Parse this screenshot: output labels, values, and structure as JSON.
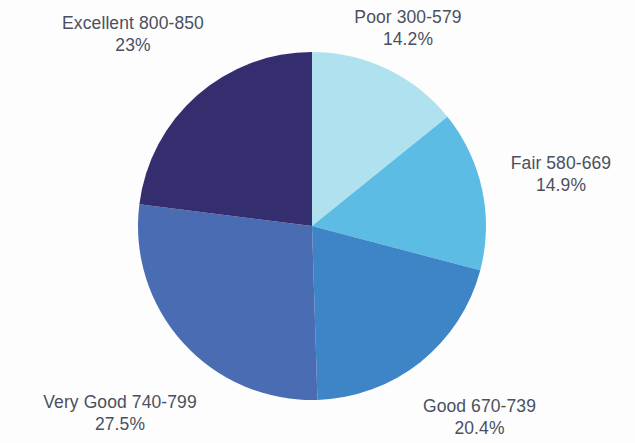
{
  "chart_data": {
    "type": "pie",
    "title": "",
    "subtitle": "",
    "xlabel": "",
    "ylabel": "",
    "legend_position": "none",
    "grid": false,
    "background_color": "#fdfdfd",
    "label_text_color": "#4a5060",
    "start_angle_deg": 0,
    "direction": "clockwise",
    "center": {
      "x": 312,
      "y": 226
    },
    "radius": 174,
    "categories": [
      "Poor 300-579",
      "Fair 580-669",
      "Good 670-739",
      "Very Good 740-799",
      "Excellent 800-850"
    ],
    "values": [
      14.2,
      14.9,
      20.4,
      27.5,
      23
    ],
    "value_labels": [
      "14.2%",
      "14.9%",
      "20.4%",
      "27.5%",
      "23%"
    ],
    "colors": [
      "#b0e1ef",
      "#5cbce4",
      "#3d85c6",
      "#4a6cb3",
      "#342d6e"
    ],
    "slices": [
      {
        "name": "Poor 300-579",
        "value": 14.2,
        "value_label": "14.2%",
        "color": "#b0e1ef",
        "start_deg": 0,
        "end_deg": 51.12
      },
      {
        "name": "Fair 580-669",
        "value": 14.9,
        "value_label": "14.9%",
        "color": "#5cbce4",
        "start_deg": 51.12,
        "end_deg": 104.76
      },
      {
        "name": "Good 670-739",
        "value": 20.4,
        "value_label": "20.4%",
        "color": "#3d85c6",
        "start_deg": 104.76,
        "end_deg": 178.2
      },
      {
        "name": "Very Good 740-799",
        "value": 27.5,
        "value_label": "27.5%",
        "color": "#4a6cb3",
        "start_deg": 178.2,
        "end_deg": 277.2
      },
      {
        "name": "Excellent 800-850",
        "value": 23,
        "value_label": "23%",
        "color": "#342d6e",
        "start_deg": 277.2,
        "end_deg": 360
      }
    ]
  },
  "labels": {
    "excellent": {
      "name": "Excellent 800-850",
      "pct": "23%"
    },
    "poor": {
      "name": "Poor 300-579",
      "pct": "14.2%"
    },
    "fair": {
      "name": "Fair 580-669",
      "pct": "14.9%"
    },
    "good": {
      "name": "Good 670-739",
      "pct": "20.4%"
    },
    "very_good": {
      "name": "Very Good 740-799",
      "pct": "27.5%"
    }
  }
}
